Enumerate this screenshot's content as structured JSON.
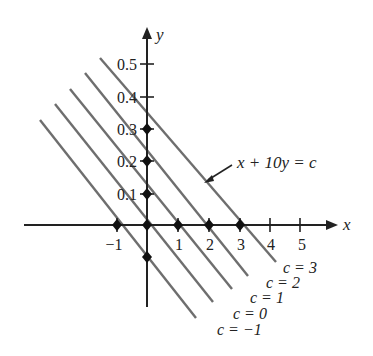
{
  "diagram": {
    "type": "coordinate-plane-level-lines",
    "equation_label": "x + 10y = c",
    "axes": {
      "x_label": "x",
      "y_label": "y",
      "x_ticks": [
        "−1",
        "1",
        "2",
        "3",
        "4",
        "5"
      ],
      "y_ticks": [
        "0.1",
        "0.2",
        "0.3",
        "0.4",
        "0.5"
      ]
    },
    "lines": [
      {
        "c": 3,
        "label": "c = 3"
      },
      {
        "c": 2,
        "label": "c = 2"
      },
      {
        "c": 1,
        "label": "c = 1"
      },
      {
        "c": 0,
        "label": "c = 0"
      },
      {
        "c": -1,
        "label": "c = −1"
      }
    ],
    "points": [
      {
        "x": -1,
        "y": 0
      },
      {
        "x": 0,
        "y": 0
      },
      {
        "x": 1,
        "y": 0
      },
      {
        "x": 2,
        "y": 0
      },
      {
        "x": 3,
        "y": 0
      },
      {
        "x": 0,
        "y": 0.1
      },
      {
        "x": 0,
        "y": 0.2
      },
      {
        "x": 0,
        "y": 0.3
      },
      {
        "x": 0,
        "y": -0.1
      }
    ],
    "colors": {
      "axis": "#222222",
      "level_line": "#6e6e6e",
      "point": "#111111"
    }
  }
}
